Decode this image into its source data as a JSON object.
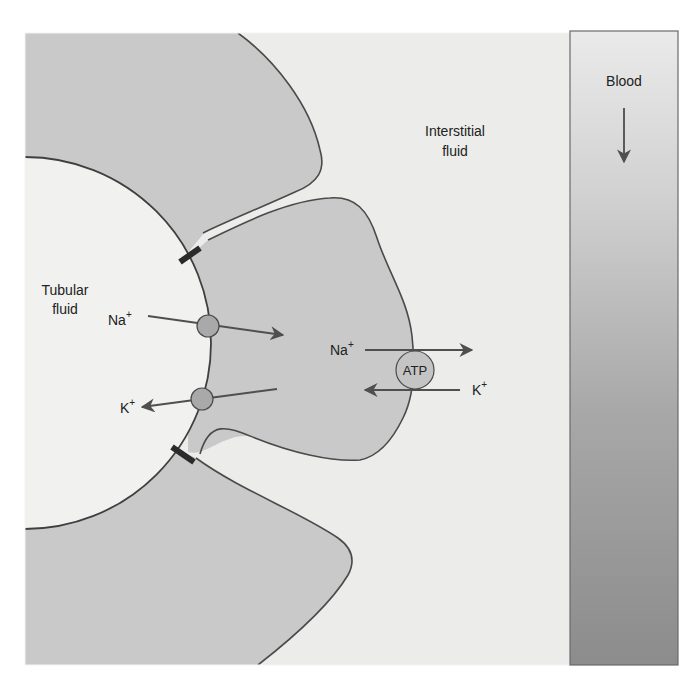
{
  "regions": {
    "tubular_fluid": {
      "line1": "Tubular",
      "line2": "fluid"
    },
    "interstitial_fluid": {
      "line1": "Interstitial",
      "line2": "fluid"
    },
    "blood": {
      "label": "Blood"
    }
  },
  "apical_transport": {
    "na": {
      "symbol": "Na",
      "charge": "+"
    },
    "k": {
      "symbol": "K",
      "charge": "+"
    }
  },
  "basolateral_pump": {
    "label": "ATP",
    "na": {
      "symbol": "Na",
      "charge": "+"
    },
    "k": {
      "symbol": "K",
      "charge": "+"
    }
  },
  "colors": {
    "page_background": "#ffffff",
    "interstitial_background": "#ececea",
    "cell_fill": "#c9c9c9",
    "tubular_fluid_fill": "#f1f1f0",
    "outline": "#4a4a4a",
    "tight_junction": "#2b2b2b",
    "channel_fill": "#a9a9a9",
    "arrow": "#4f4f4f",
    "blood_top": "#e9e9e9",
    "blood_bottom": "#8d8d8d"
  }
}
